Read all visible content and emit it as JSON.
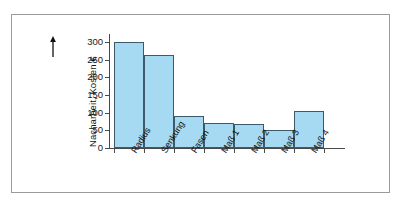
{
  "figure": {
    "frame_color": "#9b9b9b",
    "background": "#ffffff"
  },
  "axis": {
    "y_label": "Nacharbeit, Kosten €",
    "y_arrow_icon": "up-arrow-icon",
    "y_ticks": [
      "0",
      "50",
      "100",
      "150",
      "200",
      "250",
      "300"
    ],
    "y_tick_values": [
      0,
      50,
      100,
      150,
      200,
      250,
      300
    ]
  },
  "chart_data": {
    "type": "bar",
    "title": "",
    "subtitle": "",
    "xlabel": "",
    "ylabel": "Nacharbeit, Kosten €",
    "categories": [
      "Radius",
      "Senkung",
      "Fasen",
      "Maß 1",
      "Maß 2",
      "Maß 3",
      "Maß 4"
    ],
    "values": [
      300,
      263,
      90,
      71,
      68,
      51,
      105
    ],
    "ylim": [
      0,
      300
    ],
    "ytick_step": 50,
    "grid": false,
    "legend": null,
    "bar_fill": "#a6d9f2",
    "bar_border": "#3c5a6b",
    "bar_gap": 0,
    "annotations": []
  }
}
